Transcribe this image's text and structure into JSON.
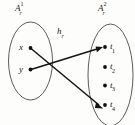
{
  "diagram": {
    "type": "set-mapping-diagram",
    "background_color": "#fdfdfc",
    "stroke_color": "#1a1a1a",
    "domain_set": {
      "label_base": "A",
      "label_sup": "2",
      "label_sub": "r",
      "label_text": "A",
      "superscript": "1",
      "subscript": "r",
      "elements": [
        {
          "id": "x",
          "label": "x",
          "subscript": ""
        },
        {
          "id": "y",
          "label": "y",
          "subscript": ""
        }
      ]
    },
    "codomain_set": {
      "label_text": "A",
      "superscript": "2",
      "subscript": "r",
      "elements": [
        {
          "id": "t1",
          "label": "t",
          "subscript": "1"
        },
        {
          "id": "t2",
          "label": "t",
          "subscript": "2"
        },
        {
          "id": "t3",
          "label": "t",
          "subscript": "3"
        },
        {
          "id": "t4",
          "label": "t",
          "subscript": "4"
        }
      ]
    },
    "mapping": {
      "label_text": "h",
      "subscript": "r",
      "arrows": [
        {
          "from": "x",
          "to": "t4"
        },
        {
          "from": "y",
          "to": "t1"
        }
      ]
    }
  }
}
